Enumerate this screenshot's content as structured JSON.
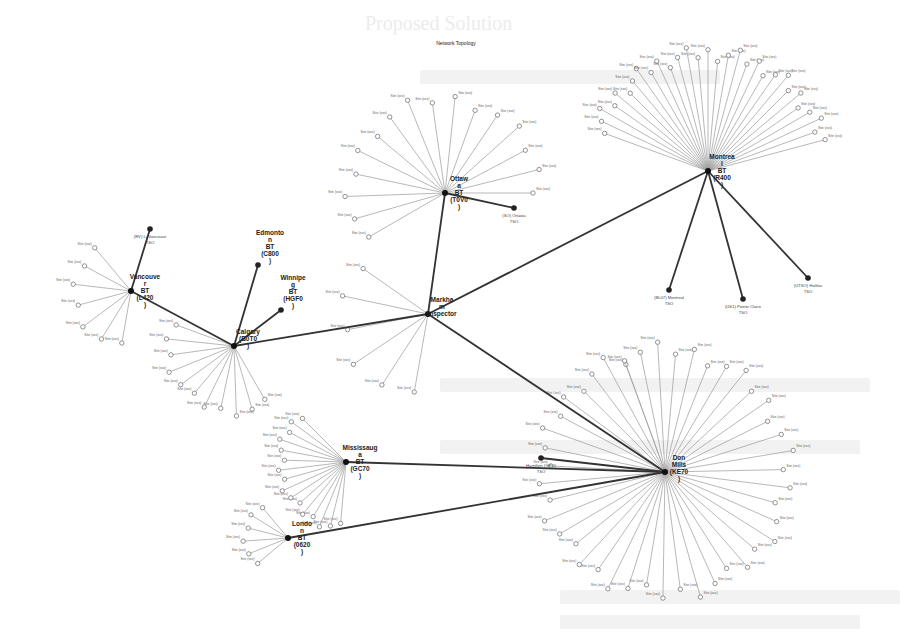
{
  "page": {
    "title": "Network Topology",
    "background_heading": "Proposed Solution"
  },
  "colors": {
    "background": "#ffffff",
    "trunk": "#333333",
    "leaf_edge": "#9a9a9a",
    "hub": "#111111"
  },
  "hubs": [
    {
      "id": "montreal",
      "label": [
        "Montrea",
        "l",
        "BT",
        "(R400",
        ")"
      ],
      "x": 708,
      "y": 171,
      "leaves": 30,
      "radius": 125,
      "start": 200,
      "end": 345
    },
    {
      "id": "ottawa",
      "label": [
        "Ottaw",
        "a",
        "BT",
        "(T0V0",
        ")"
      ],
      "x": 445,
      "y": 193,
      "leaves": 16,
      "radius": 100,
      "start": 150,
      "end": 360
    },
    {
      "id": "markham",
      "label": [
        "Markha",
        "m",
        "Inspector"
      ],
      "x": 428,
      "y": 314,
      "leaves": 6,
      "radius": 90,
      "start": 100,
      "end": 215
    },
    {
      "id": "vancouver",
      "label": [
        "Vancouve",
        "r",
        "BT",
        "(L420",
        ")"
      ],
      "x": 131,
      "y": 291,
      "leaves": 7,
      "radius": 60,
      "start": 100,
      "end": 230
    },
    {
      "id": "calgary",
      "label": [
        "Calgary",
        "(B0T0",
        ")"
      ],
      "x": 234,
      "y": 346,
      "leaves": 11,
      "radius": 70,
      "start": 60,
      "end": 200
    },
    {
      "id": "mississauga",
      "label": [
        "Mississaug",
        "a",
        "BT",
        "(GC70",
        ")"
      ],
      "x": 346,
      "y": 462,
      "leaves": 16,
      "radius": 70,
      "start": 95,
      "end": 225
    },
    {
      "id": "london",
      "label": [
        "Londo",
        "n",
        "BT",
        "(0620",
        ")"
      ],
      "x": 288,
      "y": 538,
      "leaves": 6,
      "radius": 45,
      "start": 140,
      "end": 230
    },
    {
      "id": "toronto",
      "label": [
        "Don",
        "Mills",
        "(KE70",
        ")"
      ],
      "x": 665,
      "y": 472,
      "leaves": 44,
      "radius": 130,
      "start": -110,
      "end": 250
    }
  ],
  "trunks": [
    {
      "from": "montreal",
      "to": "markham"
    },
    {
      "from": "ottawa",
      "to": "markham"
    },
    {
      "from": "markham",
      "to": "calgary"
    },
    {
      "from": "markham",
      "to": "toronto"
    },
    {
      "from": "vancouver",
      "to": "calgary"
    },
    {
      "from": "mississauga",
      "to": "toronto"
    },
    {
      "from": "london",
      "to": "toronto"
    }
  ],
  "terminals": [
    {
      "hub": "calgary",
      "x": 258,
      "y": 265,
      "label": [
        "Edmonto",
        "n",
        "BT",
        "(C800",
        ")"
      ],
      "bold": true
    },
    {
      "hub": "calgary",
      "x": 281,
      "y": 310,
      "label": [
        "Winnipe",
        "g",
        "BT",
        "(HGF0",
        ")"
      ],
      "bold": true
    },
    {
      "hub": "vancouver",
      "x": 150,
      "y": 229,
      "label": [
        "(RV) Li Vancouve",
        "TSO"
      ],
      "bold": false
    },
    {
      "hub": "ottawa",
      "x": 514,
      "y": 208,
      "label": [
        "(SO) Ottawa",
        "TSO"
      ],
      "bold": false
    },
    {
      "hub": "montreal",
      "x": 669,
      "y": 290,
      "label": [
        "(BL07) Montreal",
        "TSO"
      ],
      "bold": false
    },
    {
      "hub": "montreal",
      "x": 743,
      "y": 299,
      "label": [
        "(US1) Pointe Claire",
        "TSO"
      ],
      "bold": false
    },
    {
      "hub": "montreal",
      "x": 808,
      "y": 278,
      "label": [
        "(UTSO) Halifax",
        "TSO"
      ],
      "bold": false
    },
    {
      "hub": "toronto",
      "x": 541,
      "y": 458,
      "label": [
        "Hamilton (GEO)",
        "TSO"
      ],
      "bold": false
    }
  ],
  "leaf_label_text": "Site (xxx)"
}
